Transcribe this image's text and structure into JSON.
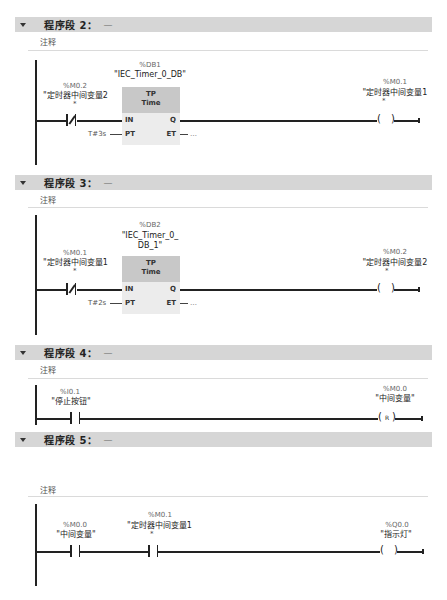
{
  "networks": [
    {
      "header": "程序段 2：",
      "dash": "—",
      "comment": "注释",
      "timer": {
        "instance_addr": "%DB1",
        "instance_name": "\"IEC_Timer_0_DB\"",
        "type": "TP",
        "datatype": "Time",
        "pins": {
          "in": "IN",
          "pt": "PT",
          "q": "Q",
          "et": "ET"
        },
        "pt_value": "T#3s",
        "et_value": "…"
      },
      "contact": {
        "type": "normally-closed",
        "addr": "%M0.2",
        "symbol": "\"定时器中间变量2",
        "star": "*"
      },
      "coil": {
        "type": "output",
        "addr": "%M0.1",
        "symbol": "\"定时器中间变量1",
        "star": "*",
        "text": ""
      }
    },
    {
      "header": "程序段 3：",
      "dash": "—",
      "comment": "注释",
      "timer": {
        "instance_addr": "%DB2",
        "instance_name": "\"IEC_Timer_0_",
        "instance_name2": "DB_1\"",
        "type": "TP",
        "datatype": "Time",
        "pins": {
          "in": "IN",
          "pt": "PT",
          "q": "Q",
          "et": "ET"
        },
        "pt_value": "T#2s",
        "et_value": "…"
      },
      "contact": {
        "type": "normally-closed",
        "addr": "%M0.1",
        "symbol": "\"定时器中间变量1",
        "star": "*"
      },
      "coil": {
        "type": "output",
        "addr": "%M0.2",
        "symbol": "\"定时器中间变量2",
        "star": "*",
        "text": ""
      }
    },
    {
      "header": "程序段 4：",
      "dash": "—",
      "comment": "注释",
      "contact": {
        "type": "normally-open",
        "addr": "%I0.1",
        "symbol": "\"停止按钮\""
      },
      "coil": {
        "type": "reset",
        "addr": "%M0.0",
        "symbol": "\"中间变量\"",
        "text": "R"
      }
    },
    {
      "header": "程序段 5：",
      "dash": "—",
      "comment": "注释",
      "contact1": {
        "type": "normally-open",
        "addr": "%M0.0",
        "symbol": "\"中间变量\""
      },
      "contact2": {
        "type": "normally-open",
        "addr": "%M0.1",
        "symbol": "\"定时器中间变量1",
        "star": "*"
      },
      "coil": {
        "type": "output",
        "addr": "%Q0.0",
        "symbol": "\"指示灯\"",
        "text": ""
      }
    }
  ]
}
